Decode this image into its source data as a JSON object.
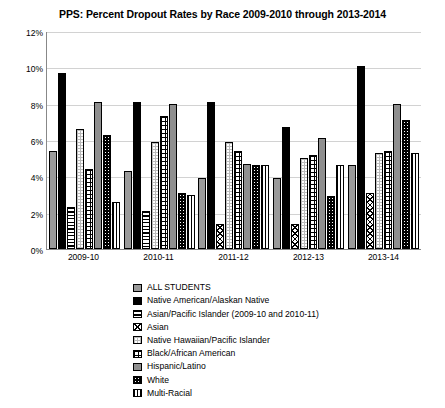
{
  "chart_data": {
    "type": "bar",
    "title": "PPS: Percent Dropout Rates by Race 2009-2010 through 2013-2014",
    "xlabel": "",
    "ylabel": "",
    "ylim": [
      0,
      12
    ],
    "ytick_labels": [
      "0%",
      "2%",
      "4%",
      "6%",
      "8%",
      "10%",
      "12%"
    ],
    "ytick_values": [
      0,
      2,
      4,
      6,
      8,
      10,
      12
    ],
    "grid": true,
    "legend_position": "bottom",
    "categories": [
      "2009-10",
      "2010-11",
      "2011-12",
      "2012-13",
      "2013-14"
    ],
    "series": [
      {
        "name": "ALL STUDENTS",
        "pattern": "solid-gray",
        "values": [
          5.4,
          4.3,
          3.9,
          3.9,
          4.6
        ]
      },
      {
        "name": "Native American/Alaskan Native",
        "pattern": "solid-black",
        "values": [
          9.7,
          8.1,
          8.1,
          6.7,
          10.1
        ]
      },
      {
        "name": "Asian/Pacific Islander (2009-10 and 2010-11)",
        "pattern": "dashed-horizontal",
        "values": [
          2.3,
          2.1,
          null,
          null,
          null
        ]
      },
      {
        "name": "Asian",
        "pattern": "crosshatch-diagonal",
        "values": [
          null,
          null,
          1.4,
          1.4,
          3.1
        ]
      },
      {
        "name": "Native Hawaiian/Pacific Islander",
        "pattern": "light-grid",
        "values": [
          6.6,
          5.9,
          5.9,
          5.0,
          5.3
        ]
      },
      {
        "name": "Black/African American",
        "pattern": "grid",
        "values": [
          4.4,
          7.3,
          5.4,
          5.2,
          5.4
        ]
      },
      {
        "name": "Hispanic/Latino",
        "pattern": "solid-gray-dark",
        "values": [
          8.1,
          8.0,
          4.7,
          6.1,
          8.0
        ]
      },
      {
        "name": "White",
        "pattern": "black-dotted",
        "values": [
          6.3,
          3.1,
          4.6,
          2.9,
          7.1
        ]
      },
      {
        "name": "Multi-Racial",
        "pattern": "vertical-stripes",
        "values": [
          2.6,
          3.0,
          4.6,
          4.6,
          5.3
        ]
      }
    ]
  }
}
